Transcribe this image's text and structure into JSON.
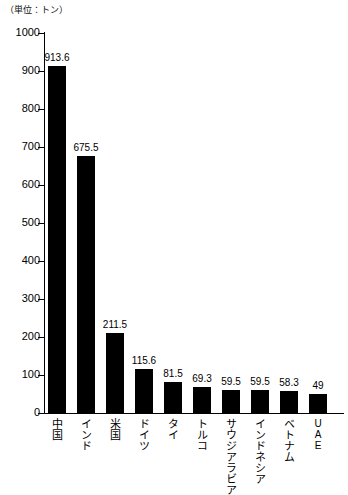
{
  "chart_data": {
    "type": "bar",
    "title": "",
    "unit_note": "（単位：トン）",
    "xlabel": "",
    "ylabel": "",
    "ylim": [
      0,
      1000
    ],
    "ytick_step": 100,
    "grid": false,
    "legend": "none",
    "bar_color": "#000000",
    "background_color": "#ffffff",
    "yticks": [
      "1000",
      "900",
      "800",
      "700",
      "600",
      "500",
      "400",
      "300",
      "200",
      "100",
      "0"
    ],
    "categories": [
      "中国",
      "インド",
      "米国",
      "ドイツ",
      "タイ",
      "トルコ",
      "サウジアラビア",
      "インドネシア",
      "ベトナム",
      "UAE"
    ],
    "values": [
      913.6,
      675.5,
      211.5,
      115.6,
      81.5,
      69.3,
      59.5,
      59.5,
      58.3,
      49
    ],
    "value_labels": [
      "913.6",
      "675.5",
      "211.5",
      "115.6",
      "81.5",
      "69.3",
      "59.5",
      "59.5",
      "58.3",
      "49"
    ],
    "category_is_latin": [
      false,
      false,
      false,
      false,
      false,
      false,
      false,
      false,
      false,
      true
    ]
  }
}
